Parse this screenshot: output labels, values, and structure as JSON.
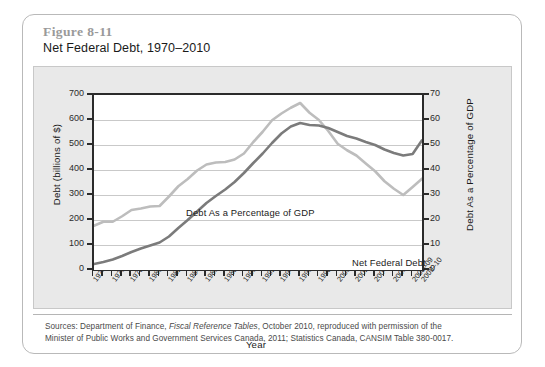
{
  "figure": {
    "number": "Figure 8-11",
    "title": "Net Federal Debt, 1970–2010"
  },
  "source": {
    "line1_a": "Sources: Department of Finance, ",
    "line1_b": "Fiscal Reference Tables",
    "line1_c": ", October 2010, reproduced with permission of the",
    "line2": "Minister of Public Works and Government Services Canada, 2011; Statistics Canada, CANSIM Table 380-0017."
  },
  "annotations": {
    "gdp_series_label": "Debt As a Percentage of GDP",
    "debt_series_label": "Net Federal Debt"
  },
  "chart_data": {
    "type": "line",
    "title": "Net Federal Debt, 1970–2010",
    "xlabel": "Year",
    "ylabel": "Debt (billions of $)",
    "ylabel_right": "Debt As a Percentage of GDP",
    "ylim": [
      0,
      700
    ],
    "ylim_right": [
      0,
      70
    ],
    "yticks": [
      0,
      100,
      200,
      300,
      400,
      500,
      600,
      700
    ],
    "yticks_right": [
      0,
      10,
      20,
      30,
      40,
      50,
      60,
      70
    ],
    "grid": true,
    "legend": "inline-annotations",
    "colors": {
      "net_federal_debt": "#7b7b7b",
      "debt_as_percentage_of_gdp": "#bdbdbd"
    },
    "x": [
      "1974-75",
      "1975-76",
      "1976-77",
      "1977-78",
      "1978-79",
      "1979-80",
      "1980-81",
      "1981-82",
      "1982-83",
      "1983-84",
      "1984-85",
      "1985-86",
      "1986-87",
      "1987-88",
      "1988-89",
      "1989-90",
      "1990-91",
      "1991-92",
      "1992-93",
      "1993-94",
      "1994-95",
      "1995-96",
      "1996-97",
      "1997-98",
      "1998-99",
      "1999-00",
      "2000-01",
      "2001-02",
      "2002-03",
      "2003-04",
      "2004-05",
      "2005-06",
      "2006-07",
      "2007-08",
      "2008-09",
      "2009-10"
    ],
    "xtick_labels": [
      "1974–75",
      "1976–77",
      "1978–79",
      "1980–81",
      "1982–83",
      "1984–85",
      "1986–87",
      "1988–89",
      "1990–91",
      "1992–93",
      "1994–95",
      "1996–97",
      "1998–99",
      "2000–01",
      "2002–03",
      "2004–05",
      "2006–07",
      "2008–09",
      "2009–10"
    ],
    "series": [
      {
        "name": "Net Federal Debt",
        "axis": "left",
        "unit": "billions of $",
        "values": [
          24,
          32,
          42,
          56,
          72,
          86,
          98,
          110,
          134,
          168,
          200,
          234,
          268,
          296,
          322,
          352,
          388,
          428,
          466,
          508,
          546,
          574,
          588,
          580,
          578,
          568,
          552,
          536,
          526,
          512,
          500,
          482,
          468,
          458,
          464,
          519
        ]
      },
      {
        "name": "Debt As a Percentage of GDP",
        "axis": "right",
        "unit": "percent of GDP",
        "values": [
          17.7,
          19.3,
          19.3,
          21.5,
          24.0,
          24.6,
          25.4,
          25.6,
          29.4,
          33.5,
          36.4,
          39.8,
          42.2,
          43.0,
          43.2,
          44.2,
          46.6,
          51.2,
          55.3,
          59.9,
          62.6,
          64.9,
          66.8,
          62.9,
          60.0,
          55.6,
          50.5,
          47.9,
          45.8,
          42.6,
          39.5,
          35.5,
          32.5,
          30.0,
          33.2,
          36.5
        ]
      }
    ]
  },
  "axis": {
    "x_title": "Year"
  }
}
